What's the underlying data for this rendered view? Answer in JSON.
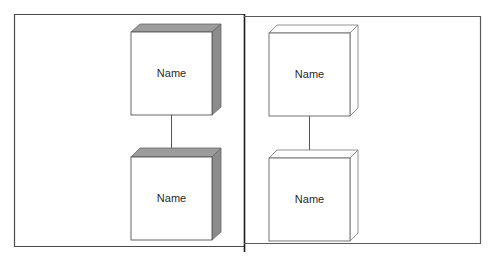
{
  "diagram": {
    "type": "deployment-node-notation",
    "panels": [
      {
        "id": "left",
        "style": "shaded",
        "nodes": [
          {
            "label": "Name"
          },
          {
            "label": "Name"
          }
        ],
        "connector": "line"
      },
      {
        "id": "right",
        "style": "outline",
        "nodes": [
          {
            "label": "Name"
          },
          {
            "label": "Name"
          }
        ],
        "connector": "line"
      }
    ],
    "colors": {
      "border": "#3a3a3a",
      "divider": "#1a1a1a",
      "shade_top": "#9a9a9a",
      "shade_side": "#8a8a8a",
      "face": "#ffffff",
      "outline": "#6a6a6a",
      "text": "#2a2a2a"
    }
  }
}
